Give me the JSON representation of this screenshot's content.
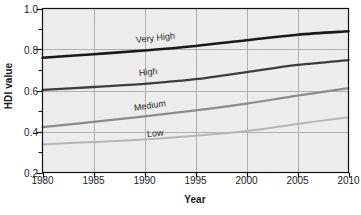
{
  "chart_data": {
    "type": "line",
    "title": "",
    "xlabel": "Year",
    "ylabel": "HDI value",
    "xlim": [
      1980,
      2010
    ],
    "ylim": [
      0.2,
      1.0
    ],
    "grid": true,
    "legend_position": "inline-labels",
    "x": [
      1980,
      1985,
      1990,
      1995,
      2000,
      2005,
      2010
    ],
    "xticks": [
      "1980",
      "1985",
      "1990",
      "1995",
      "2000",
      "2005",
      "2010"
    ],
    "yticks": [
      "0.2",
      "0.4",
      "0.6",
      "0.8",
      "1.0"
    ],
    "yticks_minor": [
      "0.3",
      "0.5",
      "0.7",
      "0.9"
    ],
    "series": [
      {
        "name": "Very High",
        "color": "#1a1a1a",
        "width": 2.6,
        "label_x": 1989.2,
        "label_y": 0.845,
        "label_rotation": -6.5,
        "values": [
          0.76,
          0.777,
          0.795,
          0.817,
          0.845,
          0.872,
          0.889
        ]
      },
      {
        "name": "High",
        "color": "#3d3d3d",
        "width": 2.3,
        "label_x": 1989.5,
        "label_y": 0.683,
        "label_rotation": -6.0,
        "values": [
          0.603,
          0.617,
          0.632,
          0.655,
          0.69,
          0.725,
          0.748
        ]
      },
      {
        "name": "Medium",
        "color": "#8c8c8c",
        "width": 2.2,
        "label_x": 1989.0,
        "label_y": 0.513,
        "label_rotation": -9.0,
        "values": [
          0.421,
          0.447,
          0.474,
          0.503,
          0.536,
          0.575,
          0.612
        ]
      },
      {
        "name": "Low",
        "color": "#b5b5b5",
        "width": 2.0,
        "label_x": 1990.2,
        "label_y": 0.388,
        "label_rotation": -5.0,
        "values": [
          0.337,
          0.349,
          0.361,
          0.379,
          0.402,
          0.437,
          0.47
        ]
      }
    ]
  },
  "style": {
    "plot_background": "#dedede",
    "frame_color": "#111111",
    "grid_color": "#b0b0b0",
    "text_color": "#1a1a1a",
    "page_background": "#ffffff"
  }
}
